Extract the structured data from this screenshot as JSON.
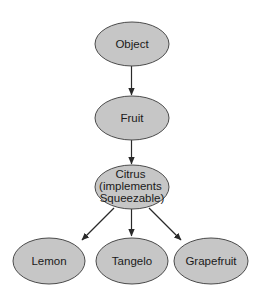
{
  "diagram": {
    "type": "class-hierarchy",
    "colors": {
      "node_fill": "#c6c6c6",
      "node_stroke": "#4a4a4a",
      "edge": "#2a2a2a",
      "text": "#1a1a1a",
      "background": "#ffffff"
    },
    "nodes": [
      {
        "id": "object",
        "label_lines": [
          "Object"
        ]
      },
      {
        "id": "fruit",
        "label_lines": [
          "Fruit"
        ]
      },
      {
        "id": "citrus",
        "label_lines": [
          "Citrus",
          "(implements",
          "Squeezable)"
        ]
      },
      {
        "id": "lemon",
        "label_lines": [
          "Lemon"
        ]
      },
      {
        "id": "tangelo",
        "label_lines": [
          "Tangelo"
        ]
      },
      {
        "id": "grapefruit",
        "label_lines": [
          "Grapefruit"
        ]
      }
    ],
    "edges": [
      {
        "from": "object",
        "to": "fruit"
      },
      {
        "from": "fruit",
        "to": "citrus"
      },
      {
        "from": "citrus",
        "to": "lemon"
      },
      {
        "from": "citrus",
        "to": "tangelo"
      },
      {
        "from": "citrus",
        "to": "grapefruit"
      }
    ]
  }
}
